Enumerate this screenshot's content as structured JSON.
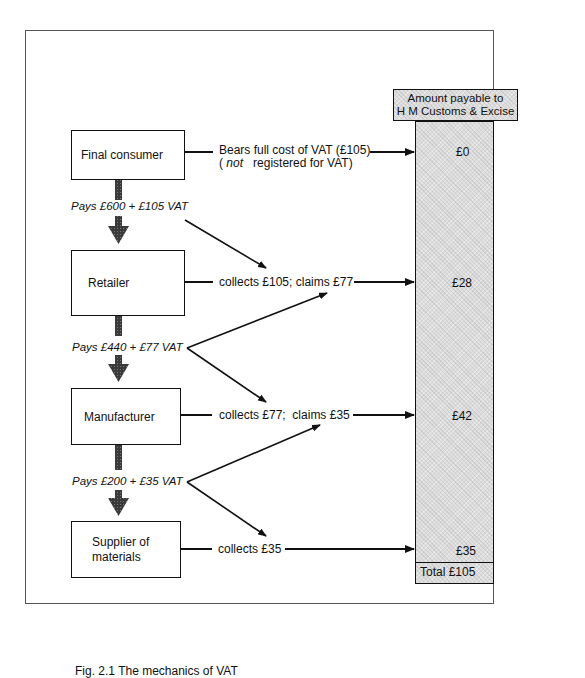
{
  "diagram": {
    "type": "flow",
    "column_header": "Amount payable to H M Customs & Excise",
    "column_header_lines": [
      "Amount payable to",
      "H M Customs & Excise"
    ],
    "stages": [
      {
        "name": "Final consumer",
        "action": "Bears full cost of VAT (£105)",
        "note_prefix": "(",
        "note_emph": "not",
        "note_rest": "registered for VAT)",
        "amount_payable": "£0"
      },
      {
        "name": "Retailer",
        "action": "collects £105; claims £77",
        "amount_payable": "£28"
      },
      {
        "name": "Manufacturer",
        "action": "collects £77;  claims £35",
        "amount_payable": "£42"
      },
      {
        "name_lines": [
          "Supplier of",
          "materials"
        ],
        "name": "Supplier of materials",
        "action": "collects £35",
        "amount_payable": "£35"
      }
    ],
    "payments": [
      {
        "from": "Final consumer",
        "to": "Retailer",
        "label": "Pays £600 + £105 VAT"
      },
      {
        "from": "Retailer",
        "to": "Manufacturer",
        "label": "Pays £440 + £77 VAT"
      },
      {
        "from": "Manufacturer",
        "to": "Supplier of materials",
        "label": "Pays £200 + £35 VAT"
      }
    ],
    "total": "Total  £105",
    "caption": "Fig. 2.1  The mechanics of VAT"
  }
}
